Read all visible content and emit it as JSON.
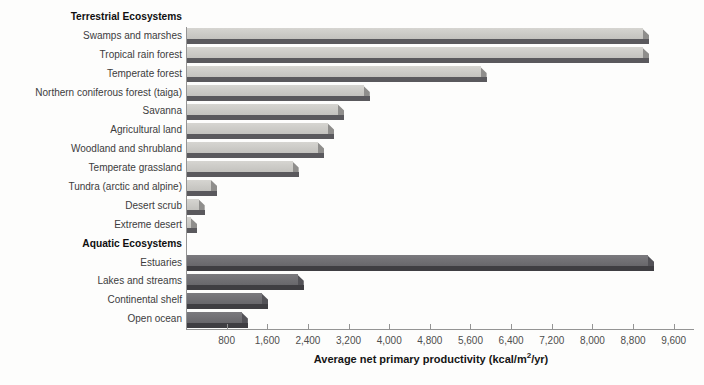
{
  "axis": {
    "max": 10000,
    "ticks": [
      {
        "label": "800",
        "value": 800
      },
      {
        "label": "1,600",
        "value": 1600
      },
      {
        "label": "2,400",
        "value": 2400
      },
      {
        "label": "3,200",
        "value": 3200
      },
      {
        "label": "4,000",
        "value": 4000
      },
      {
        "label": "4,800",
        "value": 4800
      },
      {
        "label": "5,600",
        "value": 5600
      },
      {
        "label": "6,400",
        "value": 6400
      },
      {
        "label": "7,200",
        "value": 7200
      },
      {
        "label": "8,000",
        "value": 8000
      },
      {
        "label": "8,800",
        "value": 8800
      },
      {
        "label": "9,600",
        "value": 9600
      }
    ],
    "title_pre": "Average net primary productivity (kcal/m",
    "title_sup": "2",
    "title_post": "/yr)"
  },
  "colors": {
    "terrestrial_face": "#c3c2be",
    "terrestrial_face_light": "#d6d5d1",
    "terrestrial_shadow": "#5a595d",
    "terrestrial_end": "#8f8e8c",
    "aquatic_face": "#68676b",
    "aquatic_face_light": "#7b7a7e",
    "aquatic_shadow": "#3f3e42",
    "aquatic_end": "#535257",
    "axis": "#949494"
  },
  "chart_data": {
    "type": "bar",
    "orientation": "horizontal",
    "title": "",
    "xlabel": "Average net primary productivity (kcal/m²/yr)",
    "ylabel": "",
    "xlim": [
      0,
      10000
    ],
    "xticks": [
      800,
      1600,
      2400,
      3200,
      4000,
      4800,
      5600,
      6400,
      7200,
      8000,
      8800,
      9600
    ],
    "grid": false,
    "legend": "none",
    "groups": [
      {
        "name": "Terrestrial Ecosystems",
        "categories": [
          "Swamps and marshes",
          "Tropical rain forest",
          "Temperate forest",
          "Northern coniferous forest (taiga)",
          "Savanna",
          "Agricultural land",
          "Woodland and shrubland",
          "Temperate grassland",
          "Tundra (arctic and alpine)",
          "Desert scrub",
          "Extreme desert"
        ],
        "values": [
          9000,
          9000,
          5800,
          3500,
          3000,
          2800,
          2600,
          2100,
          500,
          250,
          100
        ]
      },
      {
        "name": "Aquatic Ecosystems",
        "categories": [
          "Estuaries",
          "Lakes and streams",
          "Continental shelf",
          "Open ocean"
        ],
        "values": [
          9100,
          2200,
          1500,
          1100
        ]
      }
    ]
  }
}
